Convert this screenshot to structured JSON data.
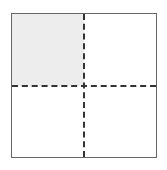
{
  "figure": {
    "name": "quadrant-square",
    "canvas": {
      "width": 167,
      "height": 170,
      "background_color": "#ffffff"
    },
    "square": {
      "border_color": "#666666",
      "border_width_px": 1,
      "fill_color": "#ffffff",
      "left_px": 11,
      "top_px": 13,
      "width_px": 146,
      "height_px": 145
    },
    "dividers": {
      "color": "#333333",
      "width_px": 2,
      "style": "dashed",
      "vertical_position": "center",
      "horizontal_position": "center"
    },
    "quadrants": [
      {
        "id": "top-left",
        "label": "",
        "fill_color": "#ededed",
        "shaded": true
      },
      {
        "id": "top-right",
        "label": "",
        "fill_color": "#ffffff",
        "shaded": false
      },
      {
        "id": "bottom-left",
        "label": "",
        "fill_color": "#ffffff",
        "shaded": false
      },
      {
        "id": "bottom-right",
        "label": "",
        "fill_color": "#ffffff",
        "shaded": false
      }
    ]
  }
}
